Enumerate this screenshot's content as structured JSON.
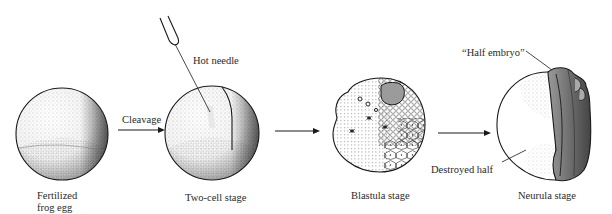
{
  "figure": {
    "stages": [
      {
        "id": "fertilized",
        "label_line1": "Fertilized",
        "label_line2": "frog egg"
      },
      {
        "id": "two-cell",
        "label": "Two-cell stage"
      },
      {
        "id": "blastula",
        "label": "Blastula stage"
      },
      {
        "id": "neurula",
        "label": "Neurula stage"
      }
    ],
    "arrows": [
      {
        "label": "Cleavage"
      },
      {
        "label": ""
      },
      {
        "label": ""
      }
    ],
    "annotations": {
      "hot_needle": "Hot needle",
      "half_embryo": "“Half embryo”",
      "destroyed_half": "Destroyed half"
    },
    "colors": {
      "ink": "#1a1a1a",
      "background": "#ffffff",
      "shade": "#555555"
    }
  }
}
